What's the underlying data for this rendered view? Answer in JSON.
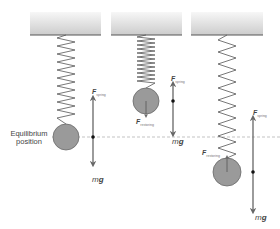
{
  "colors": {
    "ceiling_top": "#f4f4f4",
    "ceiling_bottom": "#cfcfcf",
    "ceiling_edge": "#555555",
    "spring": "#555555",
    "ball_fill": "#9a9a9a",
    "ball_stroke": "#6a6a6a",
    "arrow": "#666666",
    "dashed_line": "#aaaaaa"
  },
  "labels": {
    "equilibrium_line1": "Equilibrium",
    "equilibrium_line2": "position",
    "f_main": "F",
    "f_spring_sub": "spring",
    "f_restoring_sub": "restoring",
    "mg_m": "m",
    "mg_g": "g"
  },
  "panels": [
    {
      "name": "equilibrium",
      "ceiling_x": 30,
      "ball": {
        "cx": 66,
        "cy": 137,
        "r": 13
      },
      "arrow_x": 93,
      "arrow_top": 97,
      "arrow_bottom": 165,
      "dot_y": 137
    },
    {
      "name": "compressed",
      "ceiling_x": 111,
      "ball": {
        "cx": 146,
        "cy": 101,
        "r": 13
      },
      "arrow_x": 173,
      "arrow_top": 83,
      "arrow_bottom": 135,
      "dot_y": 101
    },
    {
      "name": "stretched",
      "ceiling_x": 191,
      "ball": {
        "cx": 227,
        "cy": 172,
        "r": 14
      },
      "arrow_x": 253,
      "arrow_top": 117,
      "arrow_bottom": 212,
      "dot_y": 172
    }
  ]
}
